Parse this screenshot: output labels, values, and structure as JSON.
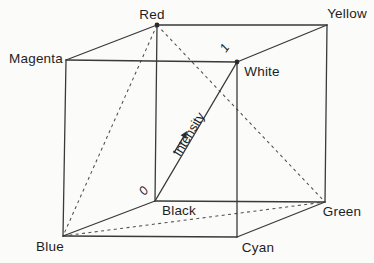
{
  "labels": {
    "red": "Red",
    "yellow": "Yellow",
    "magenta": "Magenta",
    "white": "White",
    "black": "Black",
    "green": "Green",
    "blue": "Blue",
    "cyan": "Cyan"
  },
  "axis": {
    "label": "Intensity",
    "origin": "0",
    "end": "1"
  },
  "colors": {
    "edge": "#3a3a3a",
    "dashed": "#4f4f4f",
    "text": "#1e1e1e",
    "dot": "#2b2b2b",
    "bg": "#fbfbfa"
  }
}
